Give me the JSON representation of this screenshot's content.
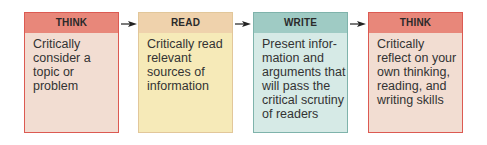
{
  "diagram": {
    "type": "process-flow",
    "steps": [
      {
        "title": "THINK",
        "text": "Critically\nconsider a\ntopic or\nproblem",
        "header_color": "#e8877a",
        "body_color": "#f2ddd2",
        "border_color": "#dc5a52"
      },
      {
        "title": "READ",
        "text": "Critically read\nrelevant\nsources of\ninformation",
        "header_color": "#efd2ac",
        "body_color": "#f6eab8",
        "border_color": "#e2c79a"
      },
      {
        "title": "WRITE",
        "text": "Present infor-\nmation and\narguments that\nwill pass the\ncritical scrutiny\nof readers",
        "header_color": "#9fcbc4",
        "body_color": "#d6eae6",
        "border_color": "#7fb3ab"
      },
      {
        "title": "THINK",
        "text": "Critically\nreflect on your\nown thinking,\nreading, and\nwriting skills",
        "header_color": "#e8877a",
        "body_color": "#f2ddd2",
        "border_color": "#dc5a52"
      }
    ],
    "connectors": [
      "arrow-right-icon",
      "arrow-right-icon",
      "arrow-right-icon"
    ]
  }
}
